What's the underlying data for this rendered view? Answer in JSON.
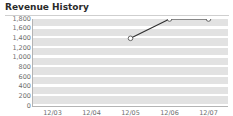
{
  "widget": {
    "title": "Revenue History"
  },
  "chart_data": {
    "type": "line",
    "title": "Revenue History",
    "xlabel": "",
    "ylabel": "",
    "categories": [
      "12/03",
      "12/04",
      "12/05",
      "12/06",
      "12/07"
    ],
    "series": [
      {
        "name": "Revenue",
        "values": [
          null,
          null,
          1400,
          1800,
          1800
        ]
      }
    ],
    "ylim": [
      0,
      1800
    ],
    "ytick_values": [
      0,
      200,
      400,
      600,
      800,
      1000,
      1200,
      1400,
      1600,
      1800
    ],
    "ytick_labels": [
      "0",
      "200",
      "400",
      "600",
      "800",
      "1,000",
      "1,200",
      "1,400",
      "1,600",
      "1,800"
    ],
    "grid": "horizontal-bands",
    "legend": "none",
    "marker": "open-circle",
    "colors": {
      "line": "#2f2f2f",
      "marker_fill": "#ffffff",
      "marker_stroke": "#555555",
      "band": "#e2e2e2",
      "plot_background": "#ffffff",
      "axis": "#b4b4b4",
      "tick_label": "#6e6e6e",
      "title": "#2b2b2b",
      "rule": "#cfcfcf"
    }
  }
}
